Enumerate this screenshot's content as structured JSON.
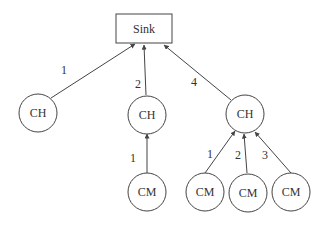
{
  "diagram": {
    "type": "tree",
    "colors": {
      "stroke": "#444444",
      "text": "#333333",
      "background": "#ffffff"
    },
    "sink": {
      "label": "Sink"
    },
    "cluster_heads": [
      {
        "id": "ch1",
        "label": "CH",
        "edge_label": "1"
      },
      {
        "id": "ch2",
        "label": "CH",
        "edge_label": "2"
      },
      {
        "id": "ch3",
        "label": "CH",
        "edge_label": "4"
      }
    ],
    "cluster_members": [
      {
        "id": "cm1",
        "parent": "ch2",
        "label": "CM",
        "edge_label": "1"
      },
      {
        "id": "cm2",
        "parent": "ch3",
        "label": "CM",
        "edge_label": "1"
      },
      {
        "id": "cm3",
        "parent": "ch3",
        "label": "CM",
        "edge_label": "2"
      },
      {
        "id": "cm4",
        "parent": "ch3",
        "label": "CM",
        "edge_label": "3"
      }
    ]
  }
}
